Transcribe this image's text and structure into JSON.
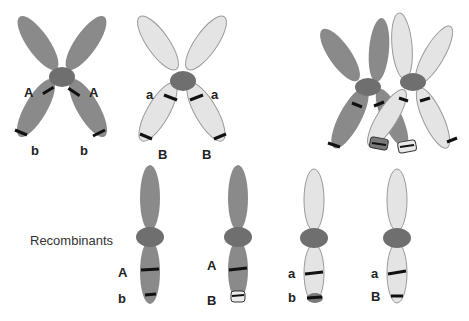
{
  "colors": {
    "dark_chromatid": "#8a8a8a",
    "light_chromatid": "#e4e4e4",
    "centromere": "#6f6f6f",
    "band": "#111111",
    "outline": "#9a9a9a"
  },
  "parent_dark": {
    "labels_top": [
      "A",
      "A"
    ],
    "labels_bottom": [
      "b",
      "b"
    ]
  },
  "parent_light": {
    "labels_top": [
      "a",
      "a"
    ],
    "labels_bottom": [
      "B",
      "B"
    ]
  },
  "crossover": {
    "description": "crossing over between homologous chromosomes"
  },
  "recombinants": {
    "title": "Recombinants",
    "items": [
      {
        "upper": "A",
        "lower": "b"
      },
      {
        "upper": "A",
        "lower": "B"
      },
      {
        "upper": "a",
        "lower": "b"
      },
      {
        "upper": "a",
        "lower": "B"
      }
    ]
  }
}
